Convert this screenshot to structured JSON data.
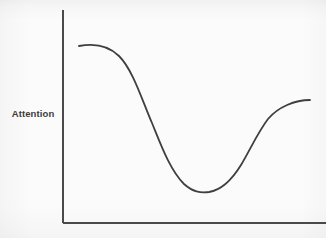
{
  "figure": {
    "kind": "line-chart-sketch",
    "width": 326,
    "height": 238,
    "background_color": "#fbfbfb"
  },
  "axes": {
    "y_axis_title": "Attention",
    "x_axis_title": "",
    "axis_color": "#4a4a4a",
    "axis_line_width": 2,
    "origin_x": 63,
    "origin_y": 223,
    "y_axis_top": 10,
    "x_axis_right": 326,
    "tick_labels_x": [],
    "tick_labels_y": [],
    "grid": false,
    "legend": null
  },
  "curve": {
    "color": "#3f3f3f",
    "line_width": 1.8,
    "path": "M 79,46 C 95,43 108,45 119,56 C 133,70 142,100 152,123 C 161,145 170,170 184,184 C 193,192 200,193 209,192 C 222,190 233,178 241,165 C 250,150 258,132 268,119 C 278,107 295,100 310,100"
  },
  "chart_data": {
    "type": "line",
    "title": "",
    "xlabel": "",
    "ylabel": "Attention",
    "grid": false,
    "legend_position": "none",
    "xlim": [
      0,
      100
    ],
    "ylim": [
      0,
      100
    ],
    "x_tick_labels": [],
    "y_tick_labels": [],
    "series": [
      {
        "name": "Attention",
        "x": [
          6,
          15,
          21,
          30,
          38,
          46,
          54,
          60,
          67,
          75,
          83,
          90,
          94
        ],
        "y": [
          83,
          85,
          78,
          63,
          47,
          31,
          21,
          16,
          17,
          25,
          42,
          60,
          66
        ]
      }
    ],
    "annotations": []
  }
}
